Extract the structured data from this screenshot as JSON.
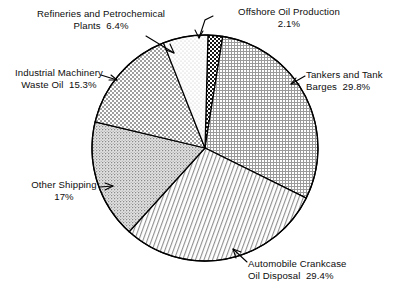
{
  "chart_data": {
    "type": "pie",
    "title": "",
    "subtitle": "",
    "xlabel": "",
    "ylabel": "",
    "legend_position": "callout-labels",
    "grid": false,
    "units": "percent",
    "total": 100.0,
    "start_angle_deg": 1.5,
    "direction": "clockwise",
    "categories": [
      "Offshore Oil Production",
      "Tankers and Tank Barges",
      "Automobile Crankcase Oil Disposal",
      "Other Shipping",
      "Industrial Machinery Waste Oil",
      "Refineries and Petrochemical Plants"
    ],
    "values": [
      2.1,
      29.8,
      29.4,
      17.0,
      15.3,
      6.4
    ],
    "slices": [
      {
        "name": "Offshore Oil Production",
        "value": 2.1,
        "value_text": "2.1%",
        "label_line1": "Offshore Oil Production",
        "label_line2": "2.1%",
        "pattern": "dark-coarse-checker",
        "fill_color": "#3a3a3a"
      },
      {
        "name": "Tankers and Tank Barges",
        "value": 29.8,
        "value_text": "29.8%",
        "label_line1": "Tankers and Tank",
        "label_line2": "Barges  29.8%",
        "pattern": "fine-grid-crosshatch",
        "fill_color": "#bfbfbf"
      },
      {
        "name": "Automobile Crankcase Oil Disposal",
        "value": 29.4,
        "value_text": "29.4%",
        "label_line1": "Automobile Crankcase",
        "label_line2": "Oil Disposal  29.4%",
        "pattern": "diagonal-hatch",
        "fill_color": "#b4b4b4"
      },
      {
        "name": "Other Shipping",
        "value": 17.0,
        "value_text": "17%",
        "label_line1": "Other Shipping",
        "label_line2": "17%",
        "pattern": "stipple-dots",
        "fill_color": "#cfcfcf"
      },
      {
        "name": "Industrial Machinery Waste Oil",
        "value": 15.3,
        "value_text": "15.3%",
        "label_line1": "Industrial Machinery",
        "label_line2": "Waste Oil  15.3%",
        "pattern": "checkerboard",
        "fill_color": "#c4c4c4"
      },
      {
        "name": "Refineries and Petrochemical Plants",
        "value": 6.4,
        "value_text": "6.4%",
        "label_line1": "Refineries and Petrochemical",
        "label_line2": "Plants  6.4%",
        "pattern": "light-dots",
        "fill_color": "#ededed"
      }
    ]
  },
  "geometry": {
    "center_x": 205,
    "center_y": 148,
    "radius": 113
  },
  "colors": {
    "outline": "#000000",
    "background": "#ffffff",
    "text": "#0d0d0d"
  }
}
